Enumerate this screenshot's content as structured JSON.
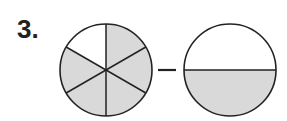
{
  "problem": {
    "number_label": "3.",
    "operator": "minus",
    "colors": {
      "shade": "#d9d9d9",
      "stroke": "#222222",
      "background": "#ffffff"
    },
    "left_circle": {
      "parts": 6,
      "shaded": 5,
      "fraction": "5/6"
    },
    "right_circle": {
      "parts": 2,
      "shaded": 1,
      "fraction": "1/2"
    }
  }
}
